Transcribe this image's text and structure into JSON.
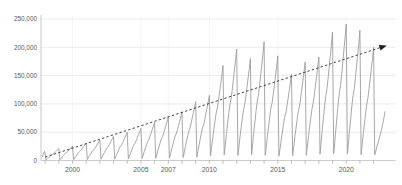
{
  "chart": {
    "title": "",
    "background": "#ffffff"
  },
  "chart_data": {
    "type": "line",
    "title": "",
    "xlabel": "",
    "ylabel": "",
    "x_axis": {
      "range_years": [
        1997.7,
        2023.6
      ],
      "tick_years": [
        1998,
        1999,
        2000,
        2001,
        2002,
        2003,
        2004,
        2005,
        2006,
        2007,
        2008,
        2009,
        2010,
        2011,
        2012,
        2013,
        2014,
        2015,
        2016,
        2017,
        2018,
        2019,
        2020,
        2021,
        2022
      ],
      "labeled_ticks": [
        2000,
        2005,
        2007,
        2010,
        2015,
        2020
      ],
      "labeled_tick_labels": [
        "2000",
        "2005",
        "2007",
        "2010",
        "2015",
        "2020"
      ]
    },
    "y_axis": {
      "range": [
        0,
        250000
      ],
      "tick_interval": 50000,
      "tick_values": [
        0,
        50000,
        100000,
        150000,
        200000,
        250000
      ],
      "tick_labels": [
        "0",
        "50,000",
        "100,000",
        "150,000",
        "200,000",
        "250,000"
      ]
    },
    "series": {
      "name": "annual-cumulative-sawtooth",
      "description": "Monthly cumulative totals that reset to near zero each January; peak value reached each December",
      "annual_peak_years": [
        1998,
        1999,
        2000,
        2001,
        2002,
        2003,
        2004,
        2005,
        2006,
        2007,
        2008,
        2009,
        2010,
        2011,
        2012,
        2013,
        2014,
        2015,
        2016,
        2017,
        2018,
        2019,
        2020,
        2021
      ],
      "annual_peak_values": [
        21000,
        26000,
        31000,
        36000,
        43000,
        50000,
        57000,
        68000,
        77000,
        86000,
        104000,
        115000,
        168000,
        197000,
        180000,
        210000,
        185000,
        152000,
        174000,
        183000,
        227000,
        241000,
        230000,
        200000
      ],
      "lead_in_points": [
        [
          1997.79,
          6000
        ],
        [
          1997.875,
          11500
        ],
        [
          1997.96,
          16500
        ]
      ],
      "intra_year_shape": [
        0.05,
        0.14,
        0.24,
        0.33,
        0.42,
        0.5,
        0.55,
        0.63,
        0.72,
        0.81,
        0.9,
        1.0
      ],
      "final_partial_year": {
        "year": 2022,
        "monthly_values": [
          10000,
          17000,
          25000,
          32000,
          40000,
          47000,
          55000,
          64000,
          75000,
          87000
        ]
      }
    },
    "trendline": {
      "start": [
        1998.0,
        6000
      ],
      "end": [
        2022.55,
        200000
      ],
      "style": "dashed",
      "arrow_end": true
    },
    "legend": "none",
    "grid": {
      "horizontal": true,
      "vertical_at_labeled_ticks": true
    },
    "colors": {
      "series": "#9d9d9d",
      "trend": "#2f2f2f",
      "arrow": "#1f1f1f",
      "grid": "#e9e9e9",
      "grid_vertical": "#f2f2f2",
      "axis": "#c6c6c6",
      "tick": "#ababab",
      "label": "#575757",
      "background": "#ffffff"
    }
  }
}
